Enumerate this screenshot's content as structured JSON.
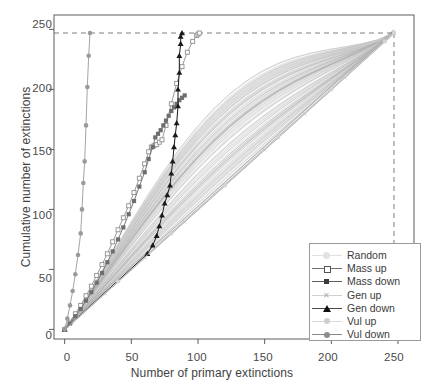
{
  "chart_data": {
    "type": "line",
    "title": "",
    "xlabel": "Number of primary extinctions",
    "ylabel": "Cumulative number of extinctions",
    "xlim": [
      -8,
      262
    ],
    "ylim": [
      -8,
      262
    ],
    "xticks": [
      0,
      50,
      100,
      150,
      200,
      250
    ],
    "yticks": [
      0,
      50,
      100,
      150,
      200,
      250
    ],
    "grid": false,
    "legend_position": "bottom-right",
    "reference_lines": {
      "total_species": 247,
      "style": "dashed",
      "color": "#8a8a8a",
      "note": "dashed horizontal line at y=247 and dashed vertical line at x=247"
    },
    "series": [
      {
        "name": "Random",
        "marker": "none",
        "line": "solid",
        "color": "#c8c8c8",
        "description": "fan of many pale grey random-removal curves forming a broad diagonal band from (0,0) to (247,247)",
        "x": [
          0,
          25,
          50,
          75,
          100,
          125,
          150,
          175,
          200,
          225,
          247
        ],
        "values": [
          0,
          26,
          52,
          78,
          104,
          131,
          157,
          183,
          209,
          233,
          247
        ]
      },
      {
        "name": "Mass up",
        "marker": "open-square",
        "line": "solid",
        "color": "#8f8f8f",
        "x": [
          0,
          4,
          8,
          12,
          16,
          20,
          24,
          28,
          32,
          36,
          40,
          44,
          48,
          52,
          56,
          60,
          63,
          65,
          67,
          69,
          71,
          73,
          76,
          80,
          84,
          88,
          92,
          96,
          99,
          100,
          101
        ],
        "values": [
          0,
          6,
          13,
          20,
          28,
          36,
          45,
          54,
          63,
          73,
          83,
          93,
          103,
          114,
          126,
          138,
          148,
          152,
          153,
          154,
          156,
          158,
          170,
          188,
          205,
          219,
          231,
          240,
          245,
          246,
          247
        ]
      },
      {
        "name": "Mass down",
        "marker": "filled-square",
        "line": "solid",
        "color": "#6e6e6e",
        "x": [
          0,
          4,
          8,
          12,
          16,
          20,
          24,
          28,
          32,
          36,
          40,
          44,
          48,
          52,
          56,
          60,
          63,
          66,
          68,
          70,
          72,
          74,
          76,
          78,
          80,
          82,
          84,
          86,
          88,
          90
        ],
        "values": [
          0,
          5,
          11,
          17,
          24,
          31,
          39,
          47,
          56,
          65,
          75,
          85,
          96,
          107,
          119,
          131,
          142,
          152,
          160,
          163,
          166,
          170,
          174,
          178,
          182,
          185,
          188,
          191,
          193,
          195
        ]
      },
      {
        "name": "Gen up",
        "marker": "cross",
        "line": "solid",
        "color": "#cacaca",
        "x": [
          0,
          30,
          60,
          90,
          120,
          150,
          180,
          210,
          240,
          247
        ],
        "values": [
          0,
          30,
          60,
          90,
          120,
          150,
          180,
          210,
          240,
          247
        ]
      },
      {
        "name": "Gen down",
        "marker": "filled-triangle",
        "line": "solid",
        "color": "#1a1a1a",
        "x": [
          0,
          62,
          66,
          69,
          71,
          73,
          75,
          77,
          79,
          80,
          81,
          82,
          83,
          84,
          85,
          85,
          86,
          86,
          87,
          87,
          88
        ],
        "values": [
          0,
          63,
          70,
          78,
          86,
          95,
          105,
          112,
          120,
          130,
          140,
          152,
          162,
          172,
          186,
          200,
          214,
          228,
          238,
          244,
          247
        ]
      },
      {
        "name": "Vul up",
        "marker": "filled-circle",
        "line": "solid",
        "color": "#d2d2d2",
        "x": [
          0,
          40,
          80,
          120,
          160,
          200,
          240,
          247
        ],
        "values": [
          0,
          40,
          80,
          120,
          160,
          200,
          240,
          247
        ]
      },
      {
        "name": "Vul down",
        "marker": "filled-circle",
        "line": "solid",
        "color": "#9a9a9a",
        "x": [
          0,
          2,
          4,
          6,
          8,
          10,
          12,
          13,
          14,
          15,
          16,
          17,
          18,
          19
        ],
        "values": [
          0,
          9,
          20,
          32,
          46,
          62,
          80,
          100,
          122,
          140,
          170,
          202,
          228,
          247
        ]
      }
    ]
  },
  "axes": {
    "y_ticks": [
      "250",
      "200",
      "150",
      "100",
      "50",
      "0"
    ],
    "x_ticks": [
      "0",
      "50",
      "100",
      "150",
      "200",
      "250"
    ],
    "x_title": "Number of primary extinctions",
    "y_title": "Cumulative number of extinctions"
  },
  "legend": {
    "items": [
      {
        "label": "Random",
        "marker": "none",
        "color": "#d5d5d5"
      },
      {
        "label": "Mass up",
        "marker": "open-square",
        "color": "#707070"
      },
      {
        "label": "Mass down",
        "marker": "filled-square",
        "color": "#4a4a4a"
      },
      {
        "label": "Gen up",
        "marker": "cross",
        "color": "#c2c2c2"
      },
      {
        "label": "Gen down",
        "marker": "filled-triangle",
        "color": "#111111"
      },
      {
        "label": "Vul up",
        "marker": "filled-circle",
        "color": "#cfcfcf"
      },
      {
        "label": "Vul down",
        "marker": "filled-circle",
        "color": "#8c8c8c"
      }
    ]
  }
}
